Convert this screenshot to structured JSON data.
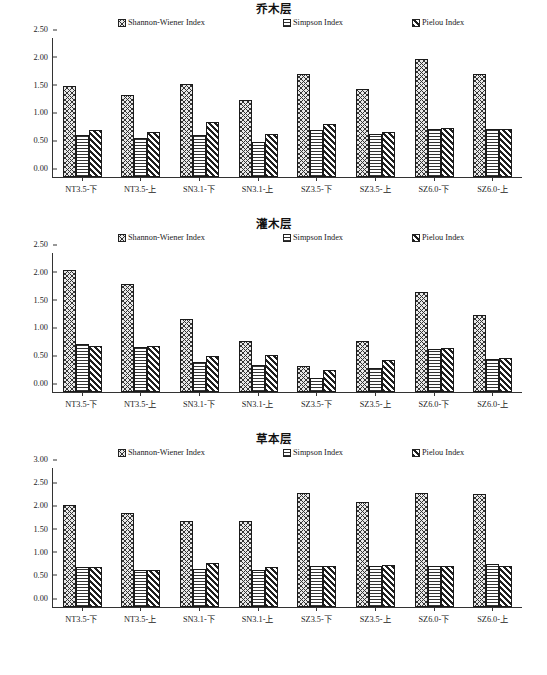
{
  "figure": {
    "categories": [
      "NT3.5-下",
      "NT3.5-上",
      "SN3.1-下",
      "SN3.1-上",
      "SZ3.5-下",
      "SZ3.5-上",
      "SZ6.0-下",
      "SZ6.0-上"
    ],
    "series_names": [
      "Shannon-Wiener Index",
      "Simpson Index",
      "Pielou Index"
    ]
  },
  "chart_data": [
    {
      "type": "bar",
      "title": "乔木层",
      "xlabel": "",
      "ylabel": "",
      "ylim": [
        0,
        2.5
      ],
      "yticks": [
        "0.00",
        "0.50",
        "1.00",
        "1.50",
        "2.00",
        "2.50"
      ],
      "ytick_values": [
        0.0,
        0.5,
        1.0,
        1.5,
        2.0,
        2.5
      ],
      "grid": false,
      "legend_position": "top",
      "categories": [
        "NT3.5-下",
        "NT3.5-上",
        "SN3.1-下",
        "SN3.1-上",
        "SZ3.5-下",
        "SZ3.5-上",
        "SZ6.0-下",
        "SZ6.0-上"
      ],
      "series": [
        {
          "name": "Shannon-Wiener Index",
          "pattern": "cross-hatch",
          "values": [
            1.64,
            1.47,
            1.67,
            1.39,
            1.85,
            1.59,
            2.13,
            1.85
          ]
        },
        {
          "name": "Simpson Index",
          "pattern": "horizontal-lines",
          "values": [
            0.75,
            0.71,
            0.76,
            0.63,
            0.85,
            0.78,
            0.87,
            0.87
          ]
        },
        {
          "name": "Pielou Index",
          "pattern": "diagonal-stripes",
          "values": [
            0.84,
            0.81,
            0.99,
            0.78,
            0.96,
            0.81,
            0.89,
            0.86
          ]
        }
      ]
    },
    {
      "type": "bar",
      "title": "灌木层",
      "xlabel": "",
      "ylabel": "",
      "ylim": [
        0,
        2.5
      ],
      "yticks": [
        "0.00",
        "0.50",
        "1.00",
        "1.50",
        "2.00",
        "2.50"
      ],
      "ytick_values": [
        0.0,
        0.5,
        1.0,
        1.5,
        2.0,
        2.5
      ],
      "grid": false,
      "legend_position": "top",
      "categories": [
        "NT3.5-下",
        "NT3.5-上",
        "SN3.1-下",
        "SN3.1-上",
        "SZ3.5-下",
        "SZ3.5-上",
        "SZ6.0-下",
        "SZ6.0-上"
      ],
      "series": [
        {
          "name": "Shannon-Wiener Index",
          "pattern": "cross-hatch",
          "values": [
            2.19,
            1.95,
            1.32,
            0.92,
            0.47,
            0.92,
            1.8,
            1.39
          ]
        },
        {
          "name": "Simpson Index",
          "pattern": "horizontal-lines",
          "values": [
            0.86,
            0.81,
            0.54,
            0.49,
            0.26,
            0.44,
            0.77,
            0.59
          ]
        },
        {
          "name": "Pielou Index",
          "pattern": "diagonal-stripes",
          "values": [
            0.83,
            0.82,
            0.65,
            0.67,
            0.4,
            0.57,
            0.79,
            0.62
          ]
        }
      ]
    },
    {
      "type": "bar",
      "title": "草本层",
      "xlabel": "",
      "ylabel": "",
      "ylim": [
        0,
        3.0
      ],
      "yticks": [
        "0.00",
        "0.50",
        "1.00",
        "1.50",
        "2.00",
        "2.50",
        "3.00"
      ],
      "ytick_values": [
        0.0,
        0.5,
        1.0,
        1.5,
        2.0,
        2.5,
        3.0
      ],
      "grid": false,
      "legend_position": "top",
      "categories": [
        "NT3.5-下",
        "NT3.5-上",
        "SN3.1-下",
        "SN3.1-上",
        "SZ3.5-下",
        "SZ3.5-上",
        "SZ6.0-下",
        "SZ6.0-上"
      ],
      "series": [
        {
          "name": "Shannon-Wiener Index",
          "pattern": "cross-hatch",
          "values": [
            2.21,
            2.02,
            1.85,
            1.86,
            2.47,
            2.26,
            2.47,
            2.43
          ]
        },
        {
          "name": "Simpson Index",
          "pattern": "horizontal-lines",
          "values": [
            0.87,
            0.8,
            0.83,
            0.79,
            0.88,
            0.88,
            0.88,
            0.92
          ]
        },
        {
          "name": "Pielou Index",
          "pattern": "diagonal-stripes",
          "values": [
            0.87,
            0.8,
            0.94,
            0.86,
            0.89,
            0.9,
            0.89,
            0.88
          ]
        }
      ]
    }
  ]
}
